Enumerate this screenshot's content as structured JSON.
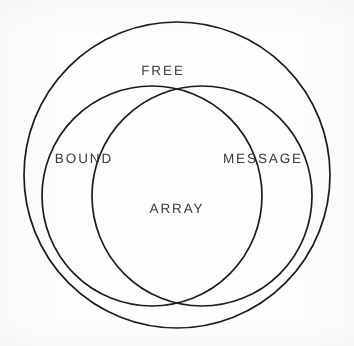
{
  "figure": {
    "name": "set-venn-diagram",
    "background_color": "#fdfdfc",
    "stroke_color": "#1c1c1c",
    "text_color": "#3a3a3a"
  },
  "labels": {
    "free": "FREE",
    "bound": "BOUND",
    "message": "MESSAGE",
    "array": "ARRAY"
  },
  "chart_data": {
    "type": "venn",
    "title": "",
    "universe": "FREE",
    "sets": [
      {
        "name": "BOUND",
        "cx": 152,
        "cy": 196,
        "r": 110
      },
      {
        "name": "MESSAGE",
        "cx": 202,
        "cy": 196,
        "r": 110
      }
    ],
    "universe_circle": {
      "name": "FREE",
      "cx": 177,
      "cy": 175,
      "r": 153
    },
    "regions": [
      {
        "label": "FREE",
        "meaning": "outer universe region, outside BOUND and MESSAGE"
      },
      {
        "label": "BOUND",
        "meaning": "left set only"
      },
      {
        "label": "MESSAGE",
        "meaning": "right set only"
      },
      {
        "label": "ARRAY",
        "meaning": "intersection of BOUND and MESSAGE"
      }
    ],
    "legend": [],
    "xlabel": "",
    "ylabel": ""
  }
}
